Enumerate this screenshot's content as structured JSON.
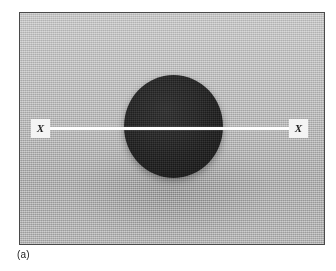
{
  "figure": {
    "caption": "(a)",
    "plate": {
      "background_color": "#b4b4b4",
      "border_color": "#4a4a4a"
    },
    "specimen": {
      "name": "dark-circular-specimen",
      "fill_color": "#1f1f1f",
      "shape": "circle"
    },
    "section_line": {
      "color": "#ffffff",
      "orientation": "horizontal",
      "label_left": "X",
      "label_right": "X",
      "label_background": "#f4f4f4",
      "label_text_color": "#1d1d1d"
    }
  }
}
